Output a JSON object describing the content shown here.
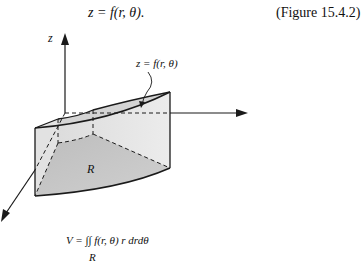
{
  "header": {
    "equation": "z = f(r, θ).",
    "figure_reference": "(Figure 15.4.2)"
  },
  "figure": {
    "axis_label_z": "z",
    "surface_label": "z = f(r, θ)",
    "region_label": "R",
    "volume_formula": "V = ∫∫ f(r, θ) r  drdθ",
    "volume_formula_subscript": "R",
    "colors": {
      "line": "#1a1a1a",
      "solid_fill_light": "#e6e6e6",
      "solid_fill_mid": "#cfcfcf",
      "region_fill": "#b8b8b8"
    }
  }
}
